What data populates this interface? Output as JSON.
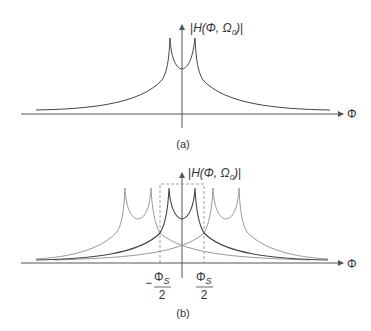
{
  "figure_a": {
    "y_label_prefix": "H(Φ, Ω",
    "y_label_sub": "0",
    "y_label_suffix": ")",
    "x_label": "Φ",
    "caption": "(a)"
  },
  "figure_b": {
    "y_label_prefix": "H(Φ, Ω",
    "y_label_sub": "0",
    "y_label_suffix": ")",
    "x_label": "Φ",
    "tick_left_sign": "−",
    "tick_left_num": "Φ",
    "tick_left_num_sub": "S",
    "tick_left_den": "2",
    "tick_right_num": "Φ",
    "tick_right_num_sub": "S",
    "tick_right_den": "2",
    "caption": "(b)"
  },
  "colors": {
    "axis": "#555555",
    "main_curve": "#444444",
    "replica_curve": "#999999",
    "dashed": "#888888"
  }
}
